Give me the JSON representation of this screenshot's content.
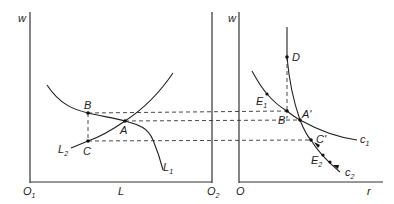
{
  "left_panel": {
    "y_axis_label": "w",
    "x_axis_label": "L",
    "origin_left": {
      "base": "O",
      "sub": "1"
    },
    "origin_right": {
      "base": "O",
      "sub": "2"
    },
    "curves": [
      {
        "name": "L1",
        "base": "L",
        "sub": "1"
      },
      {
        "name": "L2",
        "base": "L",
        "sub": "2"
      }
    ],
    "points": {
      "B": "B",
      "A": "A",
      "C": "C"
    }
  },
  "right_panel": {
    "y_axis_label": "w",
    "x_axis_label": "r",
    "origin": "O",
    "curves": [
      {
        "name": "c1",
        "base": "c",
        "sub": "1"
      },
      {
        "name": "c2",
        "base": "c",
        "sub": "2"
      }
    ],
    "points": {
      "D": "D",
      "B_prime": "B'",
      "A_prime": "A'",
      "C_prime": "C'",
      "E1": {
        "base": "E",
        "sub": "1"
      },
      "E2": {
        "base": "E",
        "sub": "2"
      }
    }
  }
}
